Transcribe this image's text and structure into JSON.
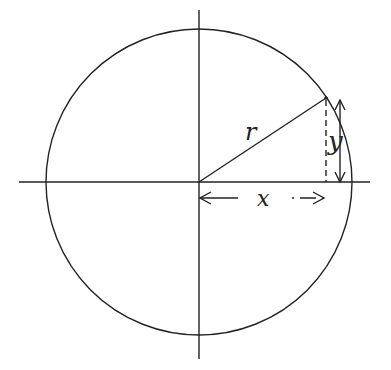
{
  "diagram": {
    "title": "",
    "center": {
      "x": 199,
      "y": 182
    },
    "radius": 153,
    "point": {
      "x": 326,
      "y": 98
    },
    "labels": {
      "radius": "r",
      "x": "x",
      "y": "y"
    },
    "stroke_color": "#222222"
  }
}
